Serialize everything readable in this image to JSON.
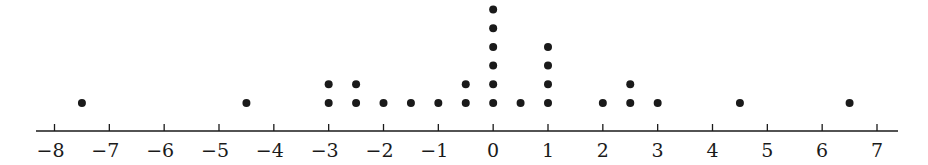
{
  "chart_data": {
    "type": "scatter",
    "subtype": "dot_plot",
    "title": "",
    "xlabel": "",
    "ylabel": "",
    "xlim": [
      -8,
      7
    ],
    "ticks": [
      -8,
      -7,
      -6,
      -5,
      -4,
      -3,
      -2,
      -1,
      0,
      1,
      2,
      3,
      4,
      5,
      6,
      7
    ],
    "tick_labels": [
      "−8",
      "−7",
      "−6",
      "−5",
      "−4",
      "−3",
      "−2",
      "−1",
      "0",
      "1",
      "2",
      "3",
      "4",
      "5",
      "6",
      "7"
    ],
    "grid": false,
    "legend": null,
    "points": [
      {
        "x": -7.5,
        "count": 1
      },
      {
        "x": -4.5,
        "count": 1
      },
      {
        "x": -3,
        "count": 2
      },
      {
        "x": -2.5,
        "count": 2
      },
      {
        "x": -2,
        "count": 1
      },
      {
        "x": -1.5,
        "count": 1
      },
      {
        "x": -1,
        "count": 1
      },
      {
        "x": -0.5,
        "count": 2
      },
      {
        "x": 0,
        "count": 6
      },
      {
        "x": 0.5,
        "count": 1
      },
      {
        "x": 1,
        "count": 4
      },
      {
        "x": 2,
        "count": 1
      },
      {
        "x": 2.5,
        "count": 2
      },
      {
        "x": 3,
        "count": 1
      },
      {
        "x": 4.5,
        "count": 1
      },
      {
        "x": 6.5,
        "count": 1
      }
    ],
    "total_count": 28
  },
  "style": {
    "ink": "#1a1a1a",
    "background": "#ffffff"
  }
}
